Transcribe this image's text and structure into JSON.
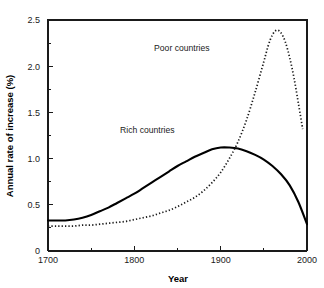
{
  "chart_data": {
    "type": "line",
    "title": "",
    "xlabel": "Year",
    "ylabel": "Annual rate of increase (%)",
    "xlim": [
      1700,
      2000
    ],
    "ylim": [
      0,
      2.5
    ],
    "xticks": [
      1700,
      1800,
      1900,
      2000
    ],
    "xticklabels": [
      "1700",
      "1800",
      "1900",
      "2000"
    ],
    "xminorticks": [
      1750,
      1850,
      1950
    ],
    "yticks": [
      0,
      0.5,
      1.0,
      1.5,
      2.0,
      2.5
    ],
    "yticklabels": [
      "0",
      "0.5",
      "1.0",
      "1.5",
      "2.0",
      "2.5"
    ],
    "yminorticks": [
      0.25,
      0.75,
      1.25,
      1.75,
      2.25
    ],
    "grid": false,
    "legend_position": "inline-annotations",
    "series": [
      {
        "name": "Rich countries",
        "style": "solid",
        "color": "#000000",
        "label_x": 1815,
        "label_y": 1.28,
        "x": [
          1700,
          1710,
          1720,
          1730,
          1740,
          1750,
          1760,
          1770,
          1780,
          1790,
          1800,
          1810,
          1820,
          1830,
          1840,
          1850,
          1860,
          1870,
          1880,
          1890,
          1900,
          1910,
          1920,
          1930,
          1940,
          1950,
          1960,
          1970,
          1980,
          1990,
          2000
        ],
        "y": [
          0.33,
          0.33,
          0.33,
          0.34,
          0.36,
          0.39,
          0.43,
          0.47,
          0.52,
          0.57,
          0.62,
          0.68,
          0.74,
          0.8,
          0.86,
          0.92,
          0.97,
          1.02,
          1.06,
          1.1,
          1.12,
          1.12,
          1.11,
          1.08,
          1.04,
          0.99,
          0.92,
          0.83,
          0.71,
          0.53,
          0.29
        ]
      },
      {
        "name": "Poor countries",
        "style": "dotted",
        "color": "#1a1a1a",
        "label_x": 1855,
        "label_y": 2.16,
        "x": [
          1700,
          1710,
          1720,
          1730,
          1740,
          1750,
          1760,
          1770,
          1780,
          1790,
          1800,
          1810,
          1820,
          1830,
          1840,
          1850,
          1860,
          1870,
          1880,
          1890,
          1900,
          1910,
          1920,
          1930,
          1940,
          1950,
          1955,
          1960,
          1965,
          1970,
          1975,
          1980,
          1985,
          1990,
          1995
        ],
        "y": [
          0.27,
          0.27,
          0.27,
          0.27,
          0.28,
          0.28,
          0.29,
          0.3,
          0.31,
          0.32,
          0.34,
          0.36,
          0.38,
          0.41,
          0.44,
          0.48,
          0.53,
          0.58,
          0.65,
          0.74,
          0.85,
          1.0,
          1.18,
          1.42,
          1.72,
          2.05,
          2.22,
          2.34,
          2.39,
          2.36,
          2.26,
          2.09,
          1.87,
          1.6,
          1.32
        ]
      }
    ]
  },
  "icons": {
    "plot_frame": "axes-frame"
  }
}
